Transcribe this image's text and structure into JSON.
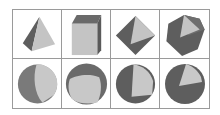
{
  "diagram": {
    "layout": {
      "rows": 2,
      "columns": 4
    },
    "colors": {
      "border": "#9a9a9a",
      "dark_face": "#5e5e5e",
      "mid_face": "#7a7a7a",
      "light_face": "#c4c4c4",
      "sphere_dark": "#6a6a6a",
      "sphere_light": "#c8c8c8"
    },
    "rows": [
      {
        "name": "polyhedra",
        "cells": [
          {
            "shape": "tetrahedron"
          },
          {
            "shape": "cube"
          },
          {
            "shape": "octahedron"
          },
          {
            "shape": "icosahedron"
          }
        ]
      },
      {
        "name": "spherical-projections",
        "cells": [
          {
            "shape": "sphere-tetrahedral-face"
          },
          {
            "shape": "sphere-cube-face"
          },
          {
            "shape": "sphere-octahedral-face"
          },
          {
            "shape": "sphere-icosahedral-face"
          }
        ]
      }
    ]
  }
}
